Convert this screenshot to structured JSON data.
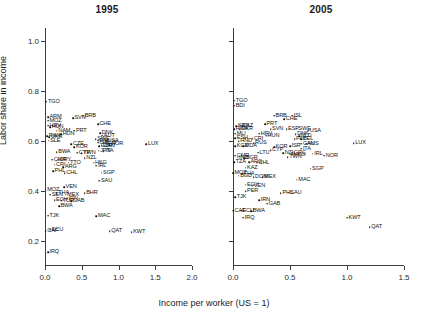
{
  "axes": {
    "y_title": "Labor share in income",
    "x_title": "Income per worker (US = 1)",
    "y_ticks": [
      "0.2",
      "0.4",
      "0.6",
      "0.8",
      "1.0"
    ],
    "x_ticks_1995": [
      "0.0",
      "0.5",
      "1.0",
      "1.5",
      "2.0"
    ],
    "x_ticks_2005": [
      "0.0",
      "0.5",
      "1.0",
      "1.5"
    ]
  },
  "panels": [
    {
      "id": "panel-1995",
      "title": "1995"
    },
    {
      "id": "panel-2005",
      "title": "2005"
    }
  ],
  "chart_data": {
    "type": "scatter",
    "xlabel": "Income per worker (US = 1)",
    "ylabel": "Labor share in income",
    "grid": false,
    "legend": null,
    "point_labels": "ISO3 country codes",
    "panels": [
      {
        "name": "1995",
        "xlim": [
          0.0,
          2.0
        ],
        "ylim": [
          0.1,
          1.05
        ],
        "xticks": [
          0.0,
          0.5,
          1.0,
          1.5,
          2.0
        ],
        "yticks": [
          0.2,
          0.4,
          0.6,
          0.8,
          1.0
        ],
        "points": [
          {
            "label": "TGO",
            "x": 0.02,
            "y": 0.755
          },
          {
            "label": "ARM",
            "x": 0.04,
            "y": 0.695
          },
          {
            "label": "MOZ",
            "x": 0.04,
            "y": 0.68
          },
          {
            "label": "HRV",
            "x": 0.04,
            "y": 0.66
          },
          {
            "label": "HUN",
            "x": 0.07,
            "y": 0.655
          },
          {
            "label": "SVN",
            "x": 0.38,
            "y": 0.69
          },
          {
            "label": "BRB",
            "x": 0.52,
            "y": 0.7
          },
          {
            "label": "CHE",
            "x": 0.72,
            "y": 0.665
          },
          {
            "label": "PRT",
            "x": 0.4,
            "y": 0.64
          },
          {
            "label": "NAM",
            "x": 0.16,
            "y": 0.64
          },
          {
            "label": "DNK",
            "x": 0.75,
            "y": 0.63
          },
          {
            "label": "AUT",
            "x": 0.78,
            "y": 0.62
          },
          {
            "label": "HUN",
            "x": 0.22,
            "y": 0.625
          },
          {
            "label": "RWA",
            "x": 0.03,
            "y": 0.618
          },
          {
            "label": "UKR",
            "x": 0.06,
            "y": 0.615
          },
          {
            "label": "SLE",
            "x": 0.05,
            "y": 0.6
          },
          {
            "label": "SWE",
            "x": 0.69,
            "y": 0.605
          },
          {
            "label": "FIN",
            "x": 0.72,
            "y": 0.6
          },
          {
            "label": "USA",
            "x": 0.83,
            "y": 0.6
          },
          {
            "label": "NOR",
            "x": 0.88,
            "y": 0.585
          },
          {
            "label": "ISR",
            "x": 0.72,
            "y": 0.592
          },
          {
            "label": "NLD",
            "x": 0.8,
            "y": 0.592
          },
          {
            "label": "CZE",
            "x": 0.36,
            "y": 0.585
          },
          {
            "label": "KOR",
            "x": 0.4,
            "y": 0.575
          },
          {
            "label": "CAN",
            "x": 0.77,
            "y": 0.58
          },
          {
            "label": "GBR",
            "x": 0.74,
            "y": 0.578
          },
          {
            "label": "LUX",
            "x": 1.38,
            "y": 0.585
          },
          {
            "label": "JPN",
            "x": 0.73,
            "y": 0.56
          },
          {
            "label": "ITA",
            "x": 0.8,
            "y": 0.558
          },
          {
            "label": "BWA",
            "x": 0.16,
            "y": 0.555
          },
          {
            "label": "CYP",
            "x": 0.44,
            "y": 0.552
          },
          {
            "label": "TWN",
            "x": 0.5,
            "y": 0.55
          },
          {
            "label": "NZL",
            "x": 0.54,
            "y": 0.53
          },
          {
            "label": "CMR",
            "x": 0.1,
            "y": 0.525
          },
          {
            "label": "URY",
            "x": 0.18,
            "y": 0.525
          },
          {
            "label": "TTO",
            "x": 0.32,
            "y": 0.512
          },
          {
            "label": "HKG",
            "x": 0.66,
            "y": 0.512
          },
          {
            "label": "IRL",
            "x": 0.7,
            "y": 0.5
          },
          {
            "label": "CRI",
            "x": 0.13,
            "y": 0.505
          },
          {
            "label": "ARG",
            "x": 0.25,
            "y": 0.495
          },
          {
            "label": "PHL",
            "x": 0.11,
            "y": 0.478
          },
          {
            "label": "CHL",
            "x": 0.27,
            "y": 0.47
          },
          {
            "label": "SGP",
            "x": 0.77,
            "y": 0.472
          },
          {
            "label": "SAU",
            "x": 0.74,
            "y": 0.44
          },
          {
            "label": "MOZ",
            "x": 0.01,
            "y": 0.405
          },
          {
            "label": "VEN",
            "x": 0.26,
            "y": 0.415
          },
          {
            "label": "THA",
            "x": 0.16,
            "y": 0.39
          },
          {
            "label": "MEX",
            "x": 0.28,
            "y": 0.385
          },
          {
            "label": "BHR",
            "x": 0.54,
            "y": 0.39
          },
          {
            "label": "SEN",
            "x": 0.07,
            "y": 0.385
          },
          {
            "label": "IRN",
            "x": 0.3,
            "y": 0.368
          },
          {
            "label": "EGY",
            "x": 0.13,
            "y": 0.362
          },
          {
            "label": "TUR",
            "x": 0.22,
            "y": 0.36
          },
          {
            "label": "GAB",
            "x": 0.36,
            "y": 0.358
          },
          {
            "label": "BWA",
            "x": 0.19,
            "y": 0.338
          },
          {
            "label": "TJK",
            "x": 0.04,
            "y": 0.3
          },
          {
            "label": "MAC",
            "x": 0.7,
            "y": 0.298
          },
          {
            "label": "CAF",
            "x": 0.01,
            "y": 0.24
          },
          {
            "label": "ECU",
            "x": 0.07,
            "y": 0.245
          },
          {
            "label": "QAT",
            "x": 0.88,
            "y": 0.24
          },
          {
            "label": "KWT",
            "x": 1.18,
            "y": 0.235
          },
          {
            "label": "IRQ",
            "x": 0.04,
            "y": 0.155
          }
        ]
      },
      {
        "name": "2005",
        "xlim": [
          0.0,
          1.5
        ],
        "ylim": [
          0.1,
          1.05
        ],
        "xticks": [
          0.0,
          0.5,
          1.0,
          1.5
        ],
        "yticks": [
          0.2,
          0.4,
          0.6,
          0.8,
          1.0
        ],
        "points": [
          {
            "label": "TGO",
            "x": 0.01,
            "y": 0.76
          },
          {
            "label": "BDI",
            "x": 0.01,
            "y": 0.74
          },
          {
            "label": "BRB",
            "x": 0.36,
            "y": 0.7
          },
          {
            "label": "ISL",
            "x": 0.52,
            "y": 0.7
          },
          {
            "label": "CHE",
            "x": 0.45,
            "y": 0.685
          },
          {
            "label": "PRT",
            "x": 0.28,
            "y": 0.665
          },
          {
            "label": "KEN",
            "x": 0.03,
            "y": 0.658
          },
          {
            "label": "KAZ",
            "x": 0.07,
            "y": 0.66
          },
          {
            "label": "RWA",
            "x": 0.01,
            "y": 0.645
          },
          {
            "label": "UKR",
            "x": 0.06,
            "y": 0.645
          },
          {
            "label": "SVN",
            "x": 0.33,
            "y": 0.645
          },
          {
            "label": "ESP",
            "x": 0.47,
            "y": 0.645
          },
          {
            "label": "SWE",
            "x": 0.56,
            "y": 0.648
          },
          {
            "label": "USA",
            "x": 0.66,
            "y": 0.64
          },
          {
            "label": "MLI",
            "x": 0.02,
            "y": 0.628
          },
          {
            "label": "HRV",
            "x": 0.23,
            "y": 0.628
          },
          {
            "label": "HUN",
            "x": 0.29,
            "y": 0.62
          },
          {
            "label": "DNK",
            "x": 0.55,
            "y": 0.625
          },
          {
            "label": "NLD",
            "x": 0.58,
            "y": 0.618
          },
          {
            "label": "ESH",
            "x": 0.02,
            "y": 0.61
          },
          {
            "label": "CRI",
            "x": 0.17,
            "y": 0.608
          },
          {
            "label": "FIN",
            "x": 0.54,
            "y": 0.605
          },
          {
            "label": "BEL",
            "x": 0.6,
            "y": 0.605
          },
          {
            "label": "HND",
            "x": 0.05,
            "y": 0.598
          },
          {
            "label": "RUS",
            "x": 0.18,
            "y": 0.59
          },
          {
            "label": "CAN",
            "x": 0.6,
            "y": 0.588
          },
          {
            "label": "AUS",
            "x": 0.64,
            "y": 0.588
          },
          {
            "label": "LUX",
            "x": 1.06,
            "y": 0.59
          },
          {
            "label": "KGZ",
            "x": 0.02,
            "y": 0.578
          },
          {
            "label": "MDA",
            "x": 0.09,
            "y": 0.578
          },
          {
            "label": "KOR",
            "x": 0.36,
            "y": 0.575
          },
          {
            "label": "ISR",
            "x": 0.5,
            "y": 0.578
          },
          {
            "label": "ITA",
            "x": 0.6,
            "y": 0.568
          },
          {
            "label": "CYP",
            "x": 0.33,
            "y": 0.562
          },
          {
            "label": "LTU",
            "x": 0.22,
            "y": 0.552
          },
          {
            "label": "NZL",
            "x": 0.44,
            "y": 0.55
          },
          {
            "label": "GRC",
            "x": 0.52,
            "y": 0.553
          },
          {
            "label": "HKG",
            "x": 0.52,
            "y": 0.545
          },
          {
            "label": "IRL",
            "x": 0.7,
            "y": 0.548
          },
          {
            "label": "CMR",
            "x": 0.02,
            "y": 0.54
          },
          {
            "label": "IND",
            "x": 0.04,
            "y": 0.532
          },
          {
            "label": "BGR",
            "x": 0.1,
            "y": 0.53
          },
          {
            "label": "TWN",
            "x": 0.48,
            "y": 0.535
          },
          {
            "label": "NOR",
            "x": 0.8,
            "y": 0.54
          },
          {
            "label": "TZA",
            "x": 0.01,
            "y": 0.515
          },
          {
            "label": "CHL",
            "x": 0.21,
            "y": 0.512
          },
          {
            "label": "ARG",
            "x": 0.14,
            "y": 0.515
          },
          {
            "label": "KAZ",
            "x": 0.11,
            "y": 0.492
          },
          {
            "label": "SGP",
            "x": 0.68,
            "y": 0.488
          },
          {
            "label": "MOZ",
            "x": 0.0,
            "y": 0.47
          },
          {
            "label": "THA",
            "x": 0.08,
            "y": 0.468
          },
          {
            "label": "BGD",
            "x": 0.05,
            "y": 0.46
          },
          {
            "label": "DOM",
            "x": 0.18,
            "y": 0.455
          },
          {
            "label": "MEX",
            "x": 0.26,
            "y": 0.455
          },
          {
            "label": "MAC",
            "x": 0.56,
            "y": 0.445
          },
          {
            "label": "EGY",
            "x": 0.11,
            "y": 0.425
          },
          {
            "label": "VEN",
            "x": 0.17,
            "y": 0.42
          },
          {
            "label": "PER",
            "x": 0.11,
            "y": 0.398
          },
          {
            "label": "PHL",
            "x": 0.42,
            "y": 0.39
          },
          {
            "label": "SAU",
            "x": 0.49,
            "y": 0.392
          },
          {
            "label": "TJK",
            "x": 0.02,
            "y": 0.375
          },
          {
            "label": "IRN",
            "x": 0.23,
            "y": 0.362
          },
          {
            "label": "GAB",
            "x": 0.3,
            "y": 0.348
          },
          {
            "label": "CAF",
            "x": 0.0,
            "y": 0.32
          },
          {
            "label": "ECU",
            "x": 0.07,
            "y": 0.32
          },
          {
            "label": "BWA",
            "x": 0.16,
            "y": 0.318
          },
          {
            "label": "IRQ",
            "x": 0.09,
            "y": 0.292
          },
          {
            "label": "KWT",
            "x": 1.0,
            "y": 0.292
          },
          {
            "label": "QAT",
            "x": 1.2,
            "y": 0.255
          }
        ]
      }
    ]
  }
}
